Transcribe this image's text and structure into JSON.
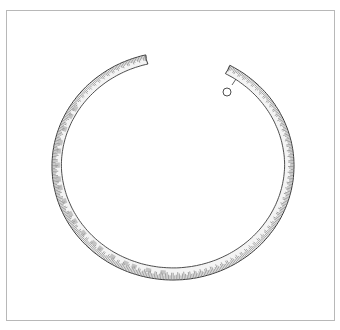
{
  "figure": {
    "frame_color": "#b8b8b8",
    "line_color": "#3a3a3a",
    "hatch_color": "#6a6a6a",
    "ring": {
      "center": [
        173,
        166
      ],
      "outer_rx": 121,
      "outer_ry": 114,
      "thickness": 11,
      "gap_start_deg": -103,
      "gap_end_deg": -62
    },
    "section_marker": {
      "circle_center": [
        227,
        92
      ],
      "circle_r": 4,
      "tick_from": [
        232,
        85
      ],
      "tick_to": [
        236,
        79
      ]
    }
  }
}
